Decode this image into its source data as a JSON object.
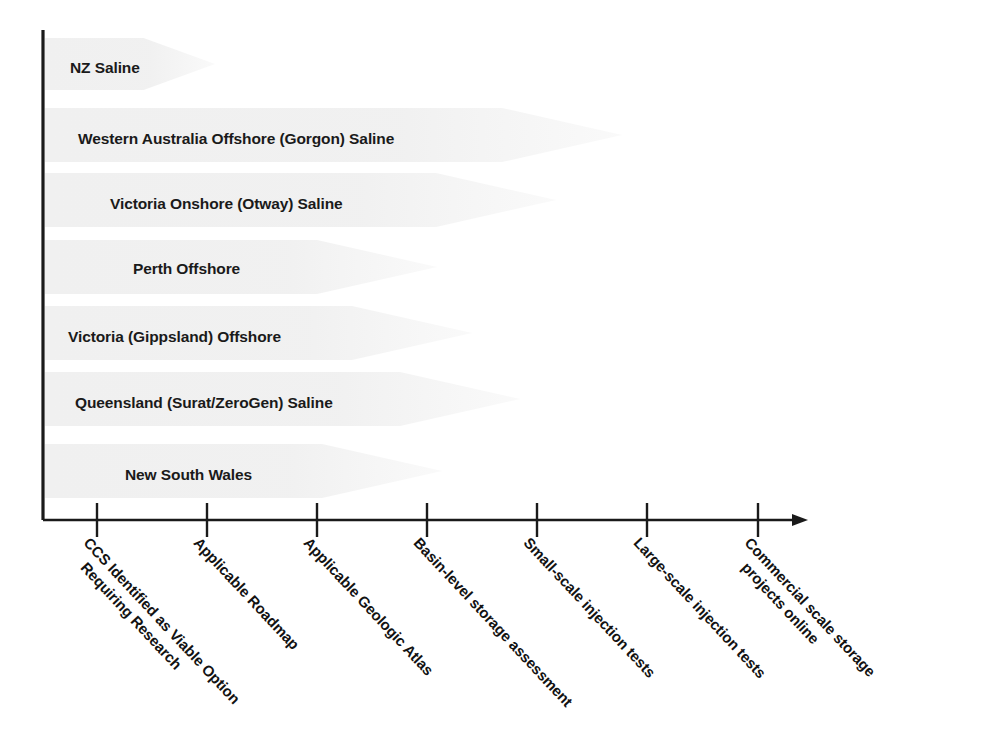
{
  "chart_data": {
    "type": "bar",
    "title": "",
    "xlabel": "",
    "ylabel": "",
    "orientation": "horizontal",
    "grid": false,
    "legend": null,
    "x_axis": {
      "arrow": true,
      "tick_count": 7,
      "stage_labels": [
        {
          "line1": "CCS Identified as Viable Option",
          "line2": "Requiring Research"
        },
        {
          "line1": "Applicable Roadmap",
          "line2": ""
        },
        {
          "line1": "Applicable Geologic Atlas",
          "line2": ""
        },
        {
          "line1": "Basin-level storage assessment",
          "line2": ""
        },
        {
          "line1": "Small-scale injection tests",
          "line2": ""
        },
        {
          "line1": "Large-scale injection tests",
          "line2": ""
        },
        {
          "line1": "Commercial scale storage",
          "line2": "projects online"
        }
      ]
    },
    "categories": [
      "NZ Saline",
      "Western Australia Offshore (Gorgon) Saline",
      "Victoria Onshore (Otway) Saline",
      "Perth Offshore",
      "Victoria (Gippsland) Offshore",
      "Queensland (Surat/ZeroGen) Saline",
      "New South Wales"
    ],
    "values": [
      1.6,
      5.2,
      4.0,
      3.2,
      3.5,
      4.3,
      3.3
    ],
    "bars": [
      {
        "label": "NZ Saline",
        "progress_stage": 1.6,
        "tip_x": 215,
        "label_x": 70,
        "band_top": 38,
        "band_height": 52
      },
      {
        "label": "Western Australia Offshore (Gorgon) Saline",
        "progress_stage": 5.2,
        "tip_x": 622,
        "label_x": 78,
        "band_top": 108,
        "band_height": 54
      },
      {
        "label": "Victoria Onshore (Otway) Saline",
        "progress_stage": 4.0,
        "tip_x": 556,
        "label_x": 110,
        "band_top": 173,
        "band_height": 54
      },
      {
        "label": "Perth Offshore",
        "progress_stage": 3.2,
        "tip_x": 437,
        "label_x": 133,
        "band_top": 240,
        "band_height": 54
      },
      {
        "label": "Victoria (Gippsland) Offshore",
        "progress_stage": 3.5,
        "tip_x": 472,
        "label_x": 68,
        "band_top": 306,
        "band_height": 54
      },
      {
        "label": "Queensland (Surat/ZeroGen) Saline",
        "progress_stage": 4.3,
        "tip_x": 520,
        "label_x": 75,
        "band_top": 372,
        "band_height": 54
      },
      {
        "label": "New South Wales",
        "progress_stage": 3.3,
        "tip_x": 442,
        "label_x": 125,
        "band_top": 444,
        "band_height": 54
      }
    ],
    "colors": {
      "bar_fill": "#f0f0f0",
      "axis": "#1a1a1a",
      "text": "#1a1a1a",
      "background": "#ffffff"
    }
  },
  "axis": {
    "y_axis_x": 43,
    "y_axis_top": 30,
    "baseline_y": 520,
    "axis_end_x": 808,
    "ticks_x": [
      97,
      207,
      317,
      427,
      537,
      647,
      758
    ],
    "tick_height": 17
  },
  "labels": {
    "row_text_y": [
      60,
      131,
      196,
      261,
      329,
      395,
      467
    ],
    "tick_label_offsets": [
      {
        "x": 97,
        "y": 534
      },
      {
        "x": 207,
        "y": 534
      },
      {
        "x": 317,
        "y": 534
      },
      {
        "x": 427,
        "y": 534
      },
      {
        "x": 537,
        "y": 534
      },
      {
        "x": 647,
        "y": 534
      },
      {
        "x": 758,
        "y": 534
      }
    ]
  }
}
